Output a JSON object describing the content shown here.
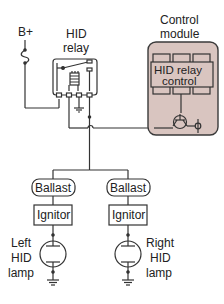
{
  "diagram": {
    "labels": {
      "bplus": "B+",
      "relay_line1": "HID",
      "relay_line2": "relay",
      "module_line1": "Control",
      "module_line2": "module",
      "relay_control_line1": "HID relay",
      "relay_control_line2": "control",
      "ballast_left": "Ballast",
      "ballast_right": "Ballast",
      "ignitor_left": "Ignitor",
      "ignitor_right": "Ignitor",
      "left_lamp_line1": "Left",
      "left_lamp_line2": "HID",
      "left_lamp_line3": "lamp",
      "right_lamp_line1": "Right",
      "right_lamp_line2": "HID",
      "right_lamp_line3": "lamp"
    },
    "colors": {
      "line": "#333333",
      "module_fill": "#d9c5c0",
      "module_stroke": "#3a3a3a",
      "background": "#ffffff"
    }
  }
}
